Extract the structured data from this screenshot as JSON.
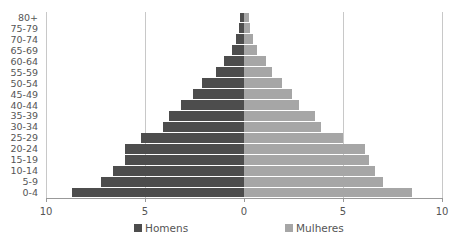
{
  "chart_data": {
    "type": "bar",
    "orientation": "horizontal",
    "subtype": "population-pyramid",
    "title": "",
    "xlabel": "",
    "ylabel": "",
    "categories": [
      "0-4",
      "5-9",
      "10-14",
      "15-19",
      "20-24",
      "25-29",
      "30-34",
      "35-39",
      "40-44",
      "45-49",
      "50-54",
      "55-59",
      "60-64",
      "65-69",
      "70-74",
      "75-79",
      "80+"
    ],
    "series": [
      {
        "name": "Homens",
        "color": "#4d4d4d",
        "side": "left",
        "values": [
          8.7,
          7.2,
          6.6,
          6.0,
          6.0,
          5.2,
          4.1,
          3.8,
          3.2,
          2.6,
          2.1,
          1.4,
          1.0,
          0.6,
          0.4,
          0.25,
          0.2
        ]
      },
      {
        "name": "Mulheres",
        "color": "#a6a6a6",
        "side": "right",
        "values": [
          8.5,
          7.0,
          6.6,
          6.3,
          6.1,
          5.0,
          3.9,
          3.6,
          2.8,
          2.4,
          1.9,
          1.4,
          1.1,
          0.65,
          0.45,
          0.3,
          0.25
        ]
      }
    ],
    "xticks": [
      "10",
      "5",
      "0",
      "5",
      "10"
    ],
    "xlim": [
      -10,
      10
    ],
    "grid": true,
    "legend_position": "bottom"
  },
  "legend": {
    "men_label": "Homens",
    "women_label": "Mulheres"
  }
}
